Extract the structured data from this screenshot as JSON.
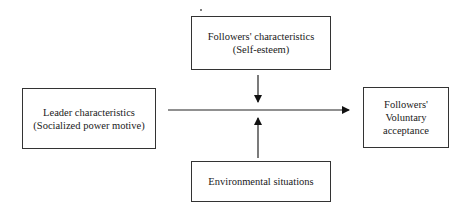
{
  "diagram": {
    "type": "moderation model",
    "nodes": {
      "moderator_top": {
        "lines": [
          "Followers' characteristics",
          "(Self-esteem)"
        ]
      },
      "independent": {
        "lines": [
          "Leader characteristics",
          "(Socialized power motive)"
        ]
      },
      "dependent": {
        "lines": [
          "Followers'",
          "Voluntary",
          "acceptance"
        ]
      },
      "moderator_bottom": {
        "lines": [
          "Environmental situations"
        ]
      }
    },
    "edges": [
      {
        "from": "independent",
        "to": "dependent",
        "label": ""
      },
      {
        "from": "moderator_top",
        "to": "independent->dependent",
        "label": ""
      },
      {
        "from": "moderator_bottom",
        "to": "independent->dependent",
        "label": ""
      }
    ]
  }
}
